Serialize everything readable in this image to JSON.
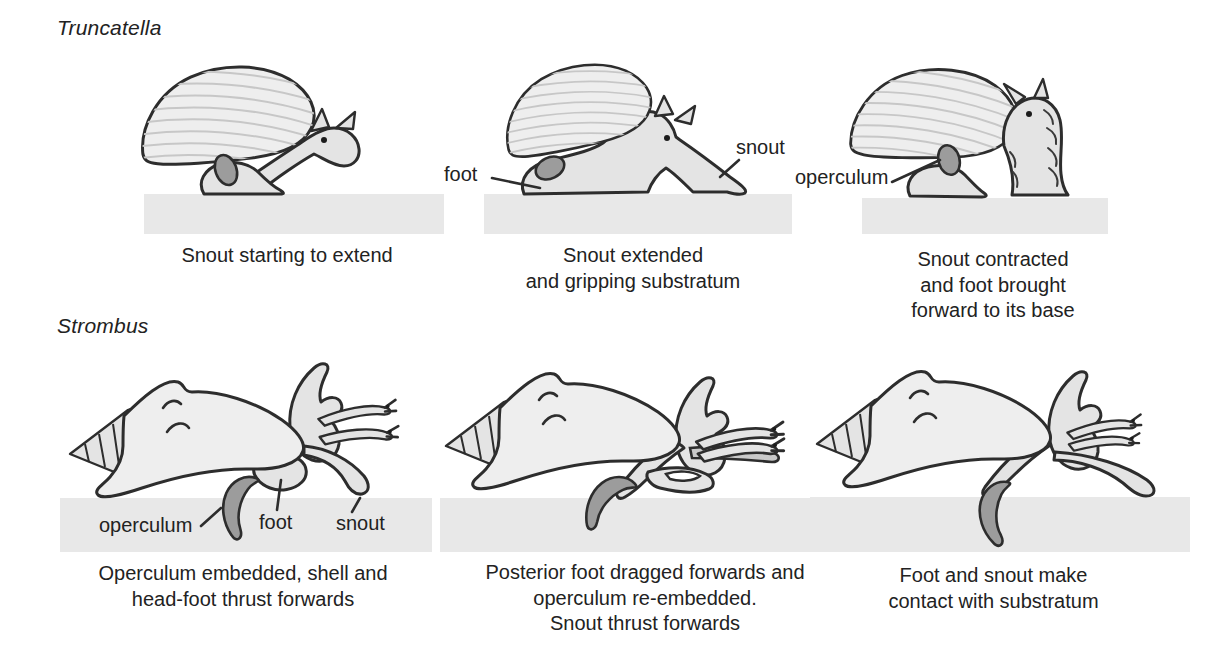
{
  "rows": [
    {
      "species_label": "Truncatella",
      "panels": [
        {
          "caption": "Snout starting to extend",
          "part_labels": []
        },
        {
          "caption": "Snout extended\nand gripping substratum",
          "part_labels": [
            {
              "text": "foot"
            },
            {
              "text": "snout"
            }
          ]
        },
        {
          "caption": "Snout contracted\nand foot brought\nforward to its base",
          "part_labels": [
            {
              "text": "operculum"
            }
          ]
        }
      ]
    },
    {
      "species_label": "Strombus",
      "panels": [
        {
          "caption": "Operculum embedded, shell and\nhead-foot thrust forwards",
          "part_labels": [
            {
              "text": "operculum"
            },
            {
              "text": "foot"
            },
            {
              "text": "snout"
            }
          ]
        },
        {
          "caption": "Posterior foot dragged forwards and\noperculum re-embedded.\nSnout thrust forwards",
          "part_labels": []
        },
        {
          "caption": "Foot and snout make\ncontact with substratum",
          "part_labels": []
        }
      ]
    }
  ],
  "colors": {
    "background": "#ffffff",
    "outline": "#2d2d2d",
    "body": "#e4e4e4",
    "shell": "#eeeeee",
    "stria": "#c7c7c7",
    "operc": "#9c9c9c",
    "mid": "#c9c9c9",
    "ground": "#e8e8e8",
    "text": "#222222"
  }
}
